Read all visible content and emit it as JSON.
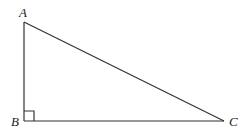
{
  "diagram": {
    "type": "right-triangle",
    "vertices": [
      {
        "name": "A",
        "label": "A",
        "x": 24,
        "y": 22
      },
      {
        "name": "B",
        "label": "B",
        "x": 24,
        "y": 121
      },
      {
        "name": "C",
        "label": "C",
        "x": 224,
        "y": 121
      }
    ],
    "right_angle_at": "B",
    "edges": [
      [
        "A",
        "B"
      ],
      [
        "B",
        "C"
      ],
      [
        "A",
        "C"
      ]
    ],
    "colors": {
      "stroke": "#333333",
      "text": "#222222",
      "background": "#ffffff"
    }
  }
}
